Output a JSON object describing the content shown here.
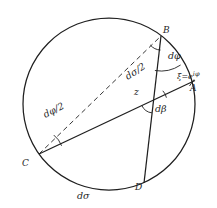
{
  "diagram": {
    "type": "geometry-circle-figure",
    "colors": {
      "background": "#ffffff",
      "ink": "#1f1f1f"
    },
    "circle": {
      "cx": 109,
      "cy": 104,
      "r": 86
    },
    "points": {
      "B": {
        "x": 161,
        "y": 36
      },
      "A": {
        "x": 192,
        "y": 82
      },
      "C": {
        "x": 39,
        "y": 154
      },
      "D": {
        "x": 144,
        "y": 183
      },
      "z": {
        "x": 154,
        "y": 100
      }
    },
    "labels": {
      "B": "B",
      "A": "A",
      "C": "C",
      "D": "D",
      "z": "z",
      "d_phi": "dφ",
      "d_sigma_half": "dσ/2",
      "d_beta": "dβ",
      "d_phi_half": "dφ/2",
      "d_sigma": "dσ",
      "xi_base": "ξ=e",
      "xi_exponent": "iφ"
    }
  }
}
